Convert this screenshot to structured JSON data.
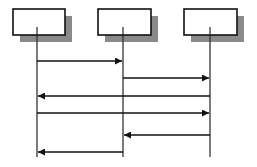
{
  "diagram": {
    "type": "sequence",
    "colors": {
      "line": "#111111",
      "box_fill": "#ffffff",
      "shadow": "#8a8a8a",
      "lifeline": "#333333"
    },
    "participants": [
      {
        "id": "p1",
        "label": "",
        "box": {
          "x": 13,
          "y": 9,
          "w": 52,
          "h": 26
        },
        "lifeline_x": 37
      },
      {
        "id": "p2",
        "label": "",
        "box": {
          "x": 98,
          "y": 9,
          "w": 53,
          "h": 26
        },
        "lifeline_x": 123
      },
      {
        "id": "p3",
        "label": "",
        "box": {
          "x": 184,
          "y": 9,
          "w": 53,
          "h": 26
        },
        "lifeline_x": 210
      }
    ],
    "shadow_offset": {
      "dx": 7,
      "dy": 7
    },
    "lifeline_end_y": 157,
    "messages": [
      {
        "from": "p1",
        "to": "p2",
        "y": 61,
        "label": ""
      },
      {
        "from": "p2",
        "to": "p3",
        "y": 78,
        "label": ""
      },
      {
        "from": "p3",
        "to": "p1",
        "y": 96,
        "label": ""
      },
      {
        "from": "p1",
        "to": "p3",
        "y": 113,
        "label": ""
      },
      {
        "from": "p3",
        "to": "p2",
        "y": 135,
        "label": ""
      },
      {
        "from": "p2",
        "to": "p1",
        "y": 152,
        "label": ""
      }
    ]
  }
}
